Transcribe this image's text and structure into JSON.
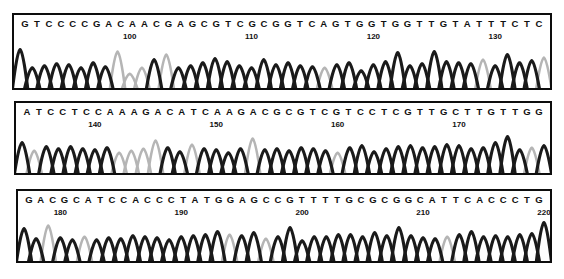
{
  "figure": {
    "kind": "dna-sequencing-chromatogram",
    "panel_count": 3,
    "ink_color": "#111111",
    "border_color": "#0d0d0d",
    "background_color": "#ffffff",
    "trace_dark_color": "#1a1a1a",
    "trace_light_color": "#b5b5b5"
  },
  "chart_data": {
    "type": "line",
    "title": "",
    "xlabel": "",
    "ylabel": "",
    "panels": [
      {
        "id": "panel-1",
        "sequence": "GTCCCCGACAACGAGCGTCGCGGTCAGTGGTGGTTGTATTTCTC",
        "bases": [
          "G",
          "T",
          "C",
          "C",
          "C",
          "C",
          "G",
          "A",
          "C",
          "A",
          "A",
          "C",
          "G",
          "A",
          "G",
          "C",
          "G",
          "T",
          "C",
          "G",
          "C",
          "G",
          "G",
          "T",
          "C",
          "A",
          "G",
          "T",
          "G",
          "G",
          "T",
          "G",
          "G",
          "T",
          "T",
          "G",
          "T",
          "A",
          "T",
          "T",
          "T",
          "C",
          "T",
          "C"
        ],
        "tick_labels": [
          "100",
          "110",
          "120",
          "130"
        ],
        "tick_base_index": [
          9,
          19,
          29,
          39
        ],
        "peak_heights": [
          38,
          20,
          22,
          24,
          23,
          20,
          25,
          21,
          36,
          14,
          20,
          28,
          33,
          20,
          22,
          25,
          29,
          26,
          22,
          20,
          28,
          23,
          25,
          22,
          21,
          20,
          23,
          25,
          17,
          23,
          26,
          35,
          22,
          24,
          36,
          26,
          25,
          24,
          28,
          22,
          33,
          25,
          27,
          30
        ],
        "peak_shades": [
          "dark",
          "dark",
          "dark",
          "dark",
          "dark",
          "dark",
          "dark",
          "dark",
          "light",
          "light",
          "light",
          "dark",
          "light",
          "dark",
          "dark",
          "dark",
          "dark",
          "dark",
          "dark",
          "dark",
          "dark",
          "dark",
          "dark",
          "dark",
          "dark",
          "light",
          "dark",
          "dark",
          "dark",
          "dark",
          "dark",
          "dark",
          "dark",
          "dark",
          "dark",
          "dark",
          "dark",
          "dark",
          "light",
          "dark",
          "dark",
          "dark",
          "dark",
          "light"
        ]
      },
      {
        "id": "panel-2",
        "sequence": "ATCCTCCAAAGACATCAAGACGCGTCGTCCTCGTTGCTTGTTGG",
        "bases": [
          "A",
          "T",
          "C",
          "C",
          "T",
          "C",
          "C",
          "A",
          "A",
          "A",
          "G",
          "A",
          "C",
          "A",
          "T",
          "C",
          "A",
          "A",
          "G",
          "A",
          "C",
          "G",
          "C",
          "G",
          "T",
          "C",
          "G",
          "T",
          "C",
          "C",
          "T",
          "C",
          "G",
          "T",
          "T",
          "G",
          "C",
          "T",
          "T",
          "G",
          "T",
          "T",
          "G",
          "G"
        ],
        "tick_labels": [
          "140",
          "150",
          "160",
          "170"
        ],
        "tick_base_index": [
          6,
          16,
          26,
          36
        ],
        "peak_heights": [
          30,
          22,
          26,
          24,
          26,
          24,
          23,
          25,
          20,
          22,
          24,
          32,
          25,
          21,
          28,
          24,
          23,
          20,
          24,
          34,
          23,
          24,
          22,
          25,
          24,
          22,
          20,
          25,
          27,
          21,
          24,
          26,
          27,
          25,
          26,
          28,
          27,
          24,
          25,
          30,
          36,
          23,
          25,
          27
        ],
        "peak_shades": [
          "dark",
          "light",
          "dark",
          "dark",
          "dark",
          "dark",
          "dark",
          "dark",
          "light",
          "light",
          "light",
          "light",
          "dark",
          "dark",
          "light",
          "dark",
          "dark",
          "dark",
          "dark",
          "light",
          "dark",
          "dark",
          "dark",
          "dark",
          "dark",
          "dark",
          "light",
          "dark",
          "dark",
          "dark",
          "dark",
          "dark",
          "dark",
          "dark",
          "dark",
          "dark",
          "dark",
          "dark",
          "dark",
          "dark",
          "dark",
          "dark",
          "light",
          "dark"
        ]
      },
      {
        "id": "panel-3",
        "sequence": "GACGCATCCACCCTATGGAGCCGTTTTGCGCGGCATTCACCCTG",
        "bases": [
          "G",
          "A",
          "C",
          "G",
          "C",
          "A",
          "T",
          "C",
          "C",
          "A",
          "C",
          "C",
          "C",
          "T",
          "A",
          "T",
          "G",
          "G",
          "A",
          "G",
          "C",
          "C",
          "G",
          "T",
          "T",
          "T",
          "T",
          "G",
          "C",
          "G",
          "C",
          "G",
          "G",
          "C",
          "A",
          "T",
          "T",
          "C",
          "A",
          "C",
          "C",
          "C",
          "T",
          "G"
        ],
        "tick_labels": [
          "180",
          "190",
          "200",
          "210",
          "220"
        ],
        "tick_base_index": [
          3,
          13,
          23,
          33,
          43
        ],
        "peak_heights": [
          32,
          22,
          35,
          23,
          21,
          24,
          21,
          23,
          22,
          25,
          24,
          23,
          21,
          24,
          25,
          26,
          29,
          26,
          25,
          28,
          22,
          24,
          33,
          20,
          24,
          24,
          26,
          26,
          24,
          28,
          25,
          33,
          25,
          23,
          22,
          24,
          26,
          29,
          24,
          25,
          24,
          26,
          27,
          38
        ],
        "peak_shades": [
          "dark",
          "dark",
          "light",
          "dark",
          "dark",
          "light",
          "dark",
          "dark",
          "dark",
          "dark",
          "dark",
          "dark",
          "dark",
          "dark",
          "dark",
          "dark",
          "dark",
          "light",
          "dark",
          "dark",
          "light",
          "dark",
          "dark",
          "dark",
          "dark",
          "dark",
          "dark",
          "dark",
          "dark",
          "dark",
          "dark",
          "dark",
          "dark",
          "dark",
          "dark",
          "light",
          "dark",
          "dark",
          "dark",
          "dark",
          "dark",
          "dark",
          "dark",
          "dark"
        ]
      }
    ]
  }
}
